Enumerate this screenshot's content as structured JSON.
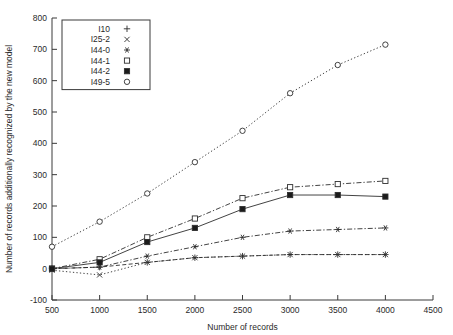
{
  "chart_data": {
    "type": "line",
    "title": "",
    "xlabel": "Number of records",
    "ylabel": "Number of records additionally recognized by the new model",
    "xlim": [
      500,
      4500
    ],
    "ylim": [
      -100,
      800
    ],
    "xticks": [
      500,
      1000,
      1500,
      2000,
      2500,
      3000,
      3500,
      4000,
      4500
    ],
    "yticks": [
      -100,
      0,
      100,
      200,
      300,
      400,
      500,
      600,
      700,
      800
    ],
    "xtick_labels": [
      "500",
      "1000",
      "1500",
      "2000",
      "2500",
      "3000",
      "3500",
      "4000",
      "4500"
    ],
    "ytick_labels": [
      "-100",
      "0",
      "100",
      "200",
      "300",
      "400",
      "500",
      "600",
      "700",
      "800"
    ],
    "grid": false,
    "legend_position": "top-left",
    "x": [
      500,
      1000,
      1500,
      2000,
      2500,
      3000,
      3500,
      4000
    ],
    "series": [
      {
        "name": "I10",
        "marker": "plus",
        "linestyle": "dashed",
        "values": [
          0,
          5,
          20,
          35,
          40,
          45,
          45,
          45
        ]
      },
      {
        "name": "I25-2",
        "marker": "cross",
        "linestyle": "dotted",
        "values": [
          -5,
          -20,
          20,
          35,
          40,
          45,
          45,
          45
        ]
      },
      {
        "name": "I44-0",
        "marker": "star-filled",
        "linestyle": "dashdot",
        "values": [
          0,
          5,
          40,
          70,
          100,
          120,
          125,
          130
        ]
      },
      {
        "name": "I44-1",
        "marker": "square-open",
        "linestyle": "dashdot",
        "values": [
          0,
          30,
          100,
          160,
          225,
          260,
          270,
          280
        ]
      },
      {
        "name": "I44-2",
        "marker": "square-filled",
        "linestyle": "solid",
        "values": [
          0,
          20,
          85,
          130,
          190,
          235,
          235,
          230
        ]
      },
      {
        "name": "I49-5",
        "marker": "circle-open",
        "linestyle": "dotted",
        "values": [
          70,
          150,
          240,
          340,
          440,
          560,
          650,
          715
        ]
      }
    ]
  },
  "legend": {
    "entries": [
      {
        "label": "I10",
        "glyph": "+"
      },
      {
        "label": "I25-2",
        "glyph": "×"
      },
      {
        "label": "I44-0",
        "glyph": "✶"
      },
      {
        "label": "I44-1",
        "glyph": "□"
      },
      {
        "label": "I44-2",
        "glyph": "■"
      },
      {
        "label": "I49-5",
        "glyph": "○"
      }
    ]
  },
  "colors": {
    "axis": "#3a3a3a",
    "line": "#2e2e2e",
    "marker_fill": "#1b1b1b",
    "background": "#ffffff"
  }
}
